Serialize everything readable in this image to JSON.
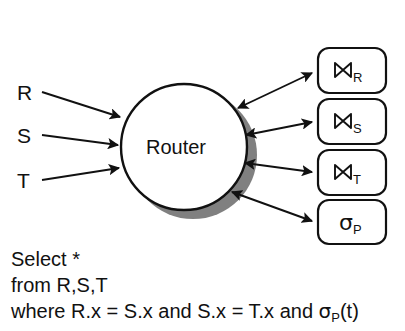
{
  "figure": {
    "kind": "dataflow-diagram",
    "background_color": "#ffffff",
    "ink_color": "#111111",
    "shadow_color": "#808080"
  },
  "router": {
    "label": "Router",
    "shape": "circle",
    "fill": "#ffffff",
    "stroke": "#111111",
    "shadow": "#808080"
  },
  "sources": [
    {
      "id": "R",
      "label": "R"
    },
    {
      "id": "S",
      "label": "S"
    },
    {
      "id": "T",
      "label": "T"
    }
  ],
  "operators": [
    {
      "id": "join-R",
      "symbol": "⋈",
      "subscript": "R",
      "icon": "join-icon"
    },
    {
      "id": "join-S",
      "symbol": "⋈",
      "subscript": "S",
      "icon": "join-icon"
    },
    {
      "id": "join-T",
      "symbol": "⋈",
      "subscript": "T",
      "icon": "join-icon"
    },
    {
      "id": "select-P",
      "symbol": "σ",
      "subscript": "P",
      "icon": "sigma-icon"
    }
  ],
  "query": {
    "line1": "Select *",
    "line2": "from R,S,T",
    "line3_a": "where R.x = S.x and S.x = T.x and ",
    "line3_sigma": "σ",
    "line3_sub": "P",
    "line3_b": "(t)"
  }
}
